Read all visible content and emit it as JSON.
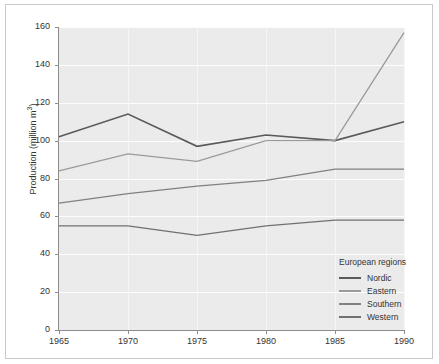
{
  "chart_data": {
    "type": "line",
    "title": "",
    "xlabel": "",
    "ylabel": "Production (million m³)",
    "ylabel_text": "Production (million m",
    "ylabel_sup": "3",
    "ylabel_tail": ")",
    "x": [
      1965,
      1970,
      1975,
      1980,
      1985,
      1990
    ],
    "xticklabels": [
      "1965",
      "1970",
      "1975",
      "1980",
      "1985",
      "1990"
    ],
    "yticks": [
      0,
      20,
      40,
      60,
      80,
      100,
      120,
      140,
      160
    ],
    "yticklabels": [
      "0",
      "20",
      "40",
      "60",
      "80",
      "100",
      "120",
      "140",
      "160"
    ],
    "ylim": [
      0,
      160
    ],
    "xlim": [
      1965,
      1990
    ],
    "grid": true,
    "legend_position": "lower-right-inside",
    "legend_title": "European regions",
    "series": [
      {
        "name": "Nordic",
        "color": "#5a5a5a",
        "values": [
          102,
          114,
          97,
          103,
          100,
          110
        ]
      },
      {
        "name": "Eastern",
        "color": "#9a9a9a",
        "values": [
          84,
          93,
          89,
          100,
          100,
          157
        ]
      },
      {
        "name": "Southern",
        "color": "#808080",
        "values": [
          67,
          72,
          76,
          79,
          85,
          85
        ]
      },
      {
        "name": "Western",
        "color": "#707070",
        "values": [
          55,
          55,
          50,
          55,
          58,
          58
        ]
      }
    ]
  },
  "legend": {
    "title": "European regions",
    "items": [
      {
        "label": "Nordic",
        "color": "#5a5a5a"
      },
      {
        "label": "Eastern",
        "color": "#9a9a9a"
      },
      {
        "label": "Southern",
        "color": "#808080"
      },
      {
        "label": "Western",
        "color": "#707070"
      }
    ]
  }
}
